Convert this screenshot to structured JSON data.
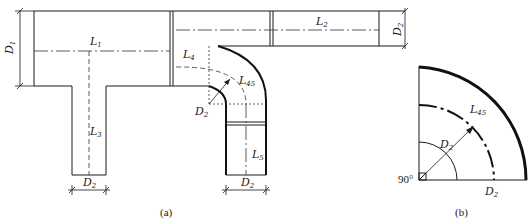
{
  "figure": {
    "part_a": {
      "caption": "(a)",
      "labels": {
        "L1": {
          "base": "L",
          "sub": "1"
        },
        "L2": {
          "base": "L",
          "sub": "2"
        },
        "L3": {
          "base": "L",
          "sub": "3"
        },
        "L4": {
          "base": "L",
          "sub": "4"
        },
        "L5": {
          "base": "L",
          "sub": "5"
        },
        "L45": {
          "base": "L",
          "sub": "45"
        },
        "D1": {
          "base": "D",
          "sub": "1"
        },
        "D2_right": {
          "base": "D",
          "sub": "2"
        },
        "D2_bend": {
          "base": "D",
          "sub": "2"
        },
        "D2_left_branch": {
          "base": "D",
          "sub": "2"
        },
        "D2_right_branch": {
          "base": "D",
          "sub": "2"
        }
      }
    },
    "part_b": {
      "caption": "(b)",
      "angle_label": "90°",
      "labels": {
        "L45": {
          "base": "L",
          "sub": "45"
        },
        "D2_radius": {
          "base": "D",
          "sub": "2"
        },
        "D2_base": {
          "base": "D",
          "sub": "2"
        }
      }
    }
  }
}
